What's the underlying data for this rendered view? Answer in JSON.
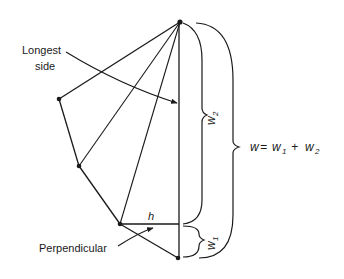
{
  "diagram": {
    "labels": {
      "longest_side_line1": "Longest",
      "longest_side_line2": "side",
      "perpendicular": "Perpendicular",
      "h": "h",
      "w1": "w",
      "w1_sub": "1",
      "w2": "w",
      "w2_sub": "2",
      "formula_w": "w",
      "formula_eq": " = ",
      "formula_w1": "w",
      "formula_w1_sub": "1",
      "formula_plus": " + ",
      "formula_w2": "w",
      "formula_w2_sub": "2"
    },
    "vertices": [
      {
        "name": "top",
        "x": 180,
        "y": 22
      },
      {
        "name": "left",
        "x": 59,
        "y": 99
      },
      {
        "name": "lower-left",
        "x": 79,
        "y": 166
      },
      {
        "name": "perp-foot-origin",
        "x": 120,
        "y": 224
      },
      {
        "name": "bottom",
        "x": 178,
        "y": 258
      }
    ],
    "colors": {
      "line": "#1a1a1a",
      "background": "#ffffff"
    }
  }
}
